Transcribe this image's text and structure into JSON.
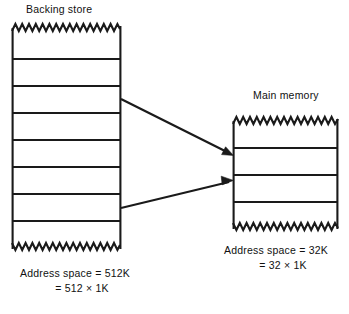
{
  "figure": {
    "background_color": "#ffffff",
    "stroke_color": "#1a1a1a",
    "backing_store": {
      "title": "Backing store",
      "block_count": 8,
      "caption_line_1": "Address space = 512K",
      "caption_line_2": "= 512 × 1K",
      "top_edge_style": "zigzag",
      "bottom_edge_style": "zigzag"
    },
    "main_memory": {
      "title": "Main memory",
      "block_count": 4,
      "caption_line_1": "Address space = 32K",
      "caption_line_2": "= 32 × 1K",
      "top_edge_style": "zigzag",
      "bottom_edge_style": "zigzag"
    },
    "arrows": [
      {
        "name": "mapping-arrow-upper",
        "from": "backing-store-block-3",
        "to": "main-memory-block-2"
      },
      {
        "name": "mapping-arrow-lower",
        "from": "backing-store-block-7",
        "to": "main-memory-block-3"
      }
    ]
  }
}
